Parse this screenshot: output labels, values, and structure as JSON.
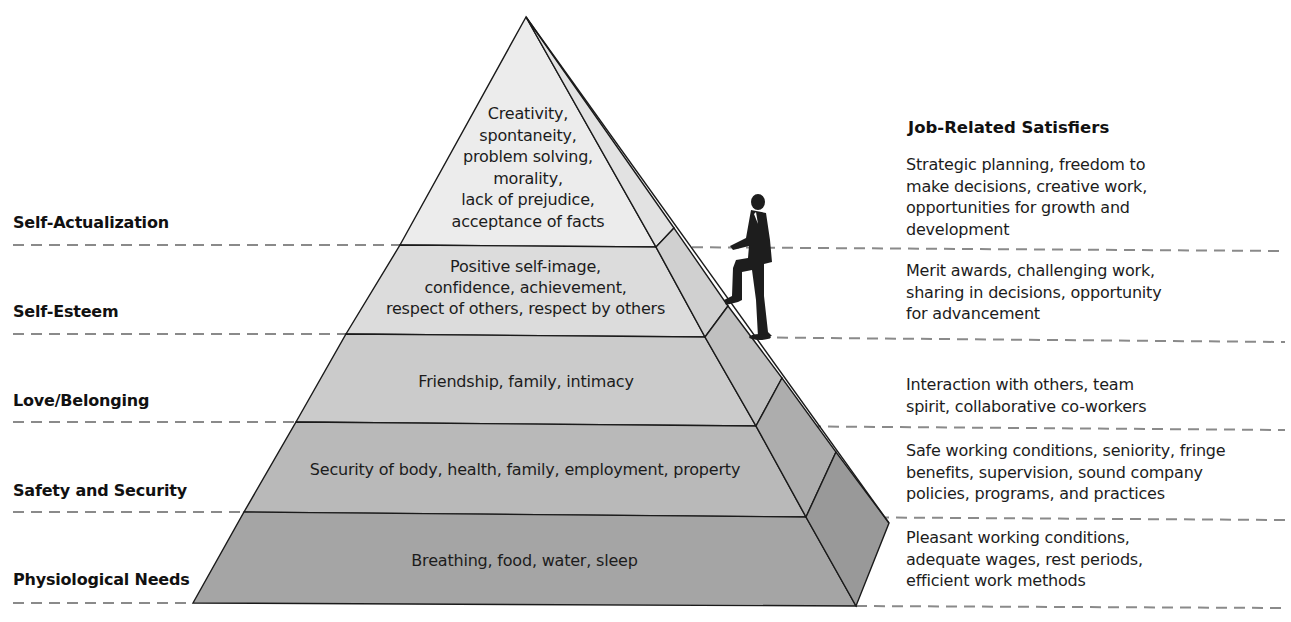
{
  "diagram": {
    "type": "pyramid",
    "colors": {
      "tier_1_top": "#ececec",
      "tier_2": "#dcdcdc",
      "tier_3": "#cbcbcb",
      "tier_4": "#b9b9b9",
      "tier_5_bottom": "#a5a5a5",
      "outline": "#1a1a1a",
      "dash": "#8a8a8a"
    }
  },
  "levels": [
    {
      "name": "Self-Actualization",
      "needs": "Creativity,\nspontaneity,\nproblem solving,\nmorality,\nlack of prejudice,\nacceptance of facts",
      "satisfiers": "Strategic planning, freedom to\nmake decisions, creative work,\nopportunities for growth and\ndevelopment"
    },
    {
      "name": "Self-Esteem",
      "needs": "Positive self-image,\nconfidence, achievement,\nrespect of others, respect by others",
      "satisfiers": "Merit awards, challenging work,\nsharing in decisions, opportunity\nfor advancement"
    },
    {
      "name": "Love/Belonging",
      "needs": "Friendship, family, intimacy",
      "satisfiers": "Interaction with others, team\nspirit, collaborative co-workers"
    },
    {
      "name": "Safety and Security",
      "needs": "Security of body, health, family, employment, property",
      "satisfiers": "Safe working conditions, seniority, fringe\nbenefits, supervision, sound company\npolicies, programs, and practices"
    },
    {
      "name": "Physiological Needs",
      "needs": "Breathing, food, water, sleep",
      "satisfiers": "Pleasant working conditions,\nadequate wages, rest periods,\nefficient work methods"
    }
  ],
  "satisfiers_heading": "Job-Related Satisfiers",
  "figure": "man-climbing-pyramid"
}
